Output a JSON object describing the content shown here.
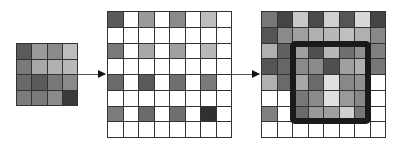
{
  "diagram": {
    "input_grid": {
      "rows": 4,
      "cols": 4,
      "cells": [
        [
          "#5a5a5a",
          "#9a9a9a",
          "#8a8a8a",
          "#bdbdbd"
        ],
        [
          "#7a7a7a",
          "#a8a8a8",
          "#b0b0b0",
          "#b8b8b8"
        ],
        [
          "#6a6a6a",
          "#5a5a5a",
          "#787878",
          "#8a8a8a"
        ],
        [
          "#7c7c7c",
          "#7a7a7a",
          "#8a8a8a",
          "#3a3a3a"
        ]
      ]
    },
    "zero_inserted_grid": {
      "rows": 8,
      "cols": 8,
      "cells": [
        [
          "#5a5a5a",
          "#ffffff",
          "#9a9a9a",
          "#ffffff",
          "#8a8a8a",
          "#ffffff",
          "#bdbdbd",
          "#ffffff"
        ],
        [
          "#ffffff",
          "#ffffff",
          "#ffffff",
          "#ffffff",
          "#ffffff",
          "#ffffff",
          "#ffffff",
          "#ffffff"
        ],
        [
          "#7a7a7a",
          "#ffffff",
          "#a8a8a8",
          "#ffffff",
          "#a0a0a0",
          "#ffffff",
          "#b8b8b8",
          "#ffffff"
        ],
        [
          "#ffffff",
          "#ffffff",
          "#ffffff",
          "#ffffff",
          "#ffffff",
          "#ffffff",
          "#ffffff",
          "#ffffff"
        ],
        [
          "#6a6a6a",
          "#ffffff",
          "#5a5a5a",
          "#ffffff",
          "#707070",
          "#ffffff",
          "#7a7a7a",
          "#ffffff"
        ],
        [
          "#ffffff",
          "#ffffff",
          "#ffffff",
          "#ffffff",
          "#ffffff",
          "#ffffff",
          "#ffffff",
          "#ffffff"
        ],
        [
          "#7c7c7c",
          "#ffffff",
          "#6a6a6a",
          "#ffffff",
          "#707070",
          "#ffffff",
          "#303030",
          "#ffffff"
        ],
        [
          "#ffffff",
          "#ffffff",
          "#ffffff",
          "#ffffff",
          "#ffffff",
          "#ffffff",
          "#ffffff",
          "#ffffff"
        ]
      ]
    },
    "output_grid": {
      "rows": 8,
      "cols": 8,
      "cells": [
        [
          "#777777",
          "#444444",
          "#c8c8c8",
          "#4a4a4a",
          "#d0d0d0",
          "#555555",
          "#d8d8d8",
          "#444444"
        ],
        [
          "#555555",
          "#8a8a8a",
          "#a0a0a0",
          "#b0b0b0",
          "#b8b8b8",
          "#c0c0c0",
          "#b0b0b0",
          "#888888"
        ],
        [
          "#b0b0b0",
          "#606060",
          "#a0a0a0",
          "#505050",
          "#b8b8b8",
          "#707070",
          "#909090",
          "#808080"
        ],
        [
          "#555555",
          "#666666",
          "#8a8a8a",
          "#8a8a8a",
          "#505050",
          "#a0a0a0",
          "#b0b0b0",
          "#777777"
        ],
        [
          "#b0b0b0",
          "#6a6a6a",
          "#a8a8a8",
          "#6a6a6a",
          "#e0e0e0",
          "#888888",
          "#909090",
          "#ffffff"
        ],
        [
          "#ffffff",
          "#ffffff",
          "#777777",
          "#8a8a8a",
          "#e0e0e0",
          "#999999",
          "#888888",
          "#ffffff"
        ],
        [
          "#808080",
          "#ffffff",
          "#6a6a6a",
          "#999999",
          "#a0a0a0",
          "#d0d0d0",
          "#777777",
          "#ffffff"
        ],
        [
          "#ffffff",
          "#ffffff",
          "#ffffff",
          "#ffffff",
          "#ffffff",
          "#ffffff",
          "#ffffff",
          "#ffffff"
        ]
      ]
    },
    "highlight": {
      "row_start": 2,
      "col_start": 2,
      "row_end": 6,
      "col_end": 6,
      "color": "#1a1a1a"
    },
    "arrows": [
      {
        "from": "input_grid",
        "to": "zero_inserted_grid"
      },
      {
        "from": "zero_inserted_grid",
        "to": "output_grid"
      }
    ]
  }
}
